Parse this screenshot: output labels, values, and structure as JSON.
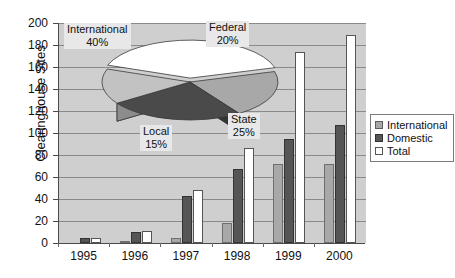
{
  "chart_data": {
    "type": "bar",
    "title": "",
    "xlabel": "",
    "ylabel": "Clearinghouse Sites",
    "categories": [
      "1995",
      "1996",
      "1997",
      "1998",
      "1999",
      "2000"
    ],
    "ylim": [
      0,
      200
    ],
    "y_ticks": [
      0,
      20,
      40,
      60,
      80,
      100,
      120,
      140,
      160,
      180,
      200
    ],
    "grid": true,
    "legend_position": "right",
    "series": [
      {
        "name": "International",
        "color": "#a8a8a8",
        "values": [
          0,
          1,
          5,
          18,
          72,
          72
        ]
      },
      {
        "name": "Domestic",
        "color": "#555555",
        "values": [
          5,
          10,
          43,
          67,
          95,
          107
        ]
      },
      {
        "name": "Total",
        "color": "#ffffff",
        "values": [
          5,
          11,
          48,
          86,
          174,
          189
        ]
      }
    ],
    "inset_pie": {
      "type": "pie",
      "labels": [
        "International",
        "Federal",
        "State",
        "Local"
      ],
      "values": [
        40,
        20,
        25,
        15
      ],
      "percent_labels": [
        "40%",
        "20%",
        "25%",
        "15%"
      ],
      "colors": [
        "#ffffff",
        "#a8a8a8",
        "#4a4a4a",
        "#c2c2c2"
      ],
      "exploded": [
        "International"
      ]
    }
  },
  "axis": {
    "y_title": "Clearinghouse Sites",
    "y_tick_labels": [
      "200",
      "180",
      "160",
      "140",
      "120",
      "100",
      "80",
      "60",
      "40",
      "20",
      "0"
    ],
    "x_tick_labels": [
      "1995",
      "1996",
      "1997",
      "1998",
      "1999",
      "2000"
    ]
  },
  "legend": {
    "items": [
      {
        "label": "International",
        "swatch": "international"
      },
      {
        "label": "Domestic",
        "swatch": "domestic"
      },
      {
        "label": "Total",
        "swatch": "total"
      }
    ]
  },
  "pie_callouts": [
    {
      "name": "International",
      "pct": "40%"
    },
    {
      "name": "Federal",
      "pct": "20%"
    },
    {
      "name": "State",
      "pct": "25%"
    },
    {
      "name": "Local",
      "pct": "15%"
    }
  ]
}
